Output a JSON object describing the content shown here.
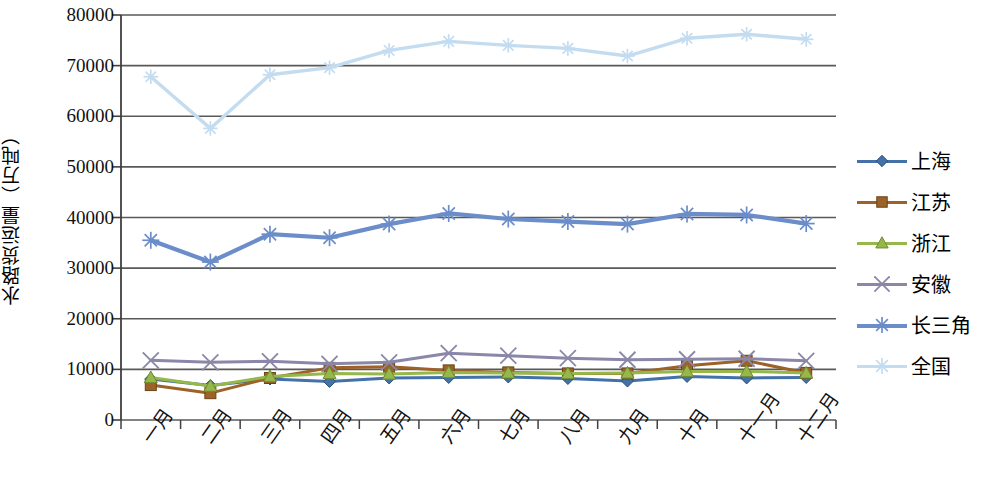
{
  "chart_data": {
    "type": "line",
    "title": "",
    "xlabel": "",
    "ylabel": "水路货运量（万吨）",
    "ylim": [
      0,
      80000
    ],
    "ytick_step": 10000,
    "yticks": [
      "0",
      "10000",
      "20000",
      "30000",
      "40000",
      "50000",
      "60000",
      "70000",
      "80000"
    ],
    "grid": true,
    "legend_position": "right",
    "categories": [
      "一月",
      "二月",
      "三月",
      "四月",
      "五月",
      "六月",
      "七月",
      "八月",
      "九月",
      "十月",
      "十一月",
      "十二月"
    ],
    "series": [
      {
        "name": "上海",
        "color": "#4472a8",
        "marker": "diamond",
        "values": [
          8100,
          6800,
          8100,
          7600,
          8300,
          8400,
          8500,
          8200,
          7700,
          8600,
          8300,
          8400
        ]
      },
      {
        "name": "江苏",
        "color": "#9c6228",
        "marker": "square",
        "values": [
          6900,
          5300,
          8300,
          10300,
          10500,
          9800,
          9400,
          9200,
          9200,
          10700,
          11700,
          9300
        ]
      },
      {
        "name": "浙江",
        "color": "#96b84a",
        "marker": "triangle",
        "values": [
          8400,
          6700,
          8600,
          9200,
          9100,
          9400,
          9300,
          9200,
          9300,
          9600,
          9600,
          9300
        ]
      },
      {
        "name": "安徽",
        "color": "#8a87a8",
        "marker": "cross",
        "values": [
          11800,
          11400,
          11600,
          11100,
          11400,
          13200,
          12700,
          12200,
          11900,
          12000,
          12100,
          11700
        ]
      },
      {
        "name": "长三角",
        "color": "#6b8dc9",
        "marker": "asterisk",
        "values": [
          35500,
          31200,
          36700,
          36000,
          38700,
          40800,
          39700,
          39200,
          38700,
          40700,
          40500,
          38800
        ]
      },
      {
        "name": "全国",
        "color": "#c3dcf0",
        "marker": "asterisk",
        "values": [
          67800,
          57600,
          68200,
          69600,
          73000,
          74800,
          74000,
          73400,
          71900,
          75400,
          76200,
          75200
        ]
      }
    ]
  },
  "legend": {
    "items": [
      {
        "label": "上海"
      },
      {
        "label": "江苏"
      },
      {
        "label": "浙江"
      },
      {
        "label": "安徽"
      },
      {
        "label": "长三角"
      },
      {
        "label": "全国"
      }
    ]
  }
}
